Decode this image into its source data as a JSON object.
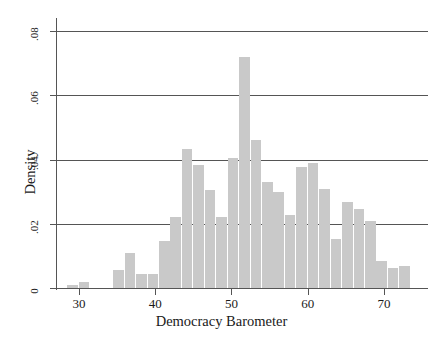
{
  "chart_data": {
    "type": "bar",
    "title": "",
    "subtitle": "",
    "xlabel": "Democracy Barometer",
    "ylabel": "Density",
    "xlim": [
      27.0,
      75.5
    ],
    "ylim": [
      0,
      0.0835
    ],
    "grid": "horizontal",
    "legend": "none",
    "bin_width": 1.5,
    "bar_color": "#c9c9c9",
    "axis_color": "#555555",
    "x_ticks": [
      {
        "value": 30,
        "label": "30"
      },
      {
        "value": 40,
        "label": "40"
      },
      {
        "value": 50,
        "label": "50"
      },
      {
        "value": 60,
        "label": "60"
      },
      {
        "value": 70,
        "label": "70"
      }
    ],
    "y_ticks": [
      {
        "value": 0,
        "label": "0"
      },
      {
        "value": 0.02,
        "label": ".02"
      },
      {
        "value": 0.04,
        "label": ".04"
      },
      {
        "value": 0.06,
        "label": ".06"
      },
      {
        "value": 0.08,
        "label": ".08"
      }
    ],
    "gridlines": [
      0.02,
      0.04,
      0.06,
      0.08
    ],
    "bins": [
      {
        "x0": 28.5,
        "x1": 30.0,
        "density": 0.0008
      },
      {
        "x0": 30.0,
        "x1": 31.5,
        "density": 0.0018
      },
      {
        "x0": 31.5,
        "x1": 33.0,
        "density": 0.0
      },
      {
        "x0": 33.0,
        "x1": 34.5,
        "density": 0.0
      },
      {
        "x0": 34.5,
        "x1": 36.0,
        "density": 0.0055
      },
      {
        "x0": 36.0,
        "x1": 37.5,
        "density": 0.011
      },
      {
        "x0": 37.5,
        "x1": 39.0,
        "density": 0.0043
      },
      {
        "x0": 39.0,
        "x1": 40.5,
        "density": 0.0043
      },
      {
        "x0": 40.5,
        "x1": 42.0,
        "density": 0.0145
      },
      {
        "x0": 42.0,
        "x1": 43.5,
        "density": 0.022
      },
      {
        "x0": 43.5,
        "x1": 45.0,
        "density": 0.0432
      },
      {
        "x0": 45.0,
        "x1": 46.5,
        "density": 0.0382
      },
      {
        "x0": 46.5,
        "x1": 48.0,
        "density": 0.0305
      },
      {
        "x0": 48.0,
        "x1": 49.5,
        "density": 0.022
      },
      {
        "x0": 49.5,
        "x1": 51.0,
        "density": 0.0405
      },
      {
        "x0": 51.0,
        "x1": 52.5,
        "density": 0.072
      },
      {
        "x0": 52.5,
        "x1": 54.0,
        "density": 0.0462
      },
      {
        "x0": 54.0,
        "x1": 55.5,
        "density": 0.033
      },
      {
        "x0": 55.5,
        "x1": 57.0,
        "density": 0.0298
      },
      {
        "x0": 57.0,
        "x1": 58.5,
        "density": 0.0228
      },
      {
        "x0": 58.5,
        "x1": 60.0,
        "density": 0.0378
      },
      {
        "x0": 60.0,
        "x1": 61.5,
        "density": 0.039
      },
      {
        "x0": 61.5,
        "x1": 63.0,
        "density": 0.0308
      },
      {
        "x0": 63.0,
        "x1": 64.5,
        "density": 0.0152
      },
      {
        "x0": 64.5,
        "x1": 66.0,
        "density": 0.0268
      },
      {
        "x0": 66.0,
        "x1": 67.5,
        "density": 0.0245
      },
      {
        "x0": 67.5,
        "x1": 69.0,
        "density": 0.021
      },
      {
        "x0": 69.0,
        "x1": 70.5,
        "density": 0.0085
      },
      {
        "x0": 70.5,
        "x1": 72.0,
        "density": 0.0062
      },
      {
        "x0": 72.0,
        "x1": 73.5,
        "density": 0.007
      }
    ]
  }
}
